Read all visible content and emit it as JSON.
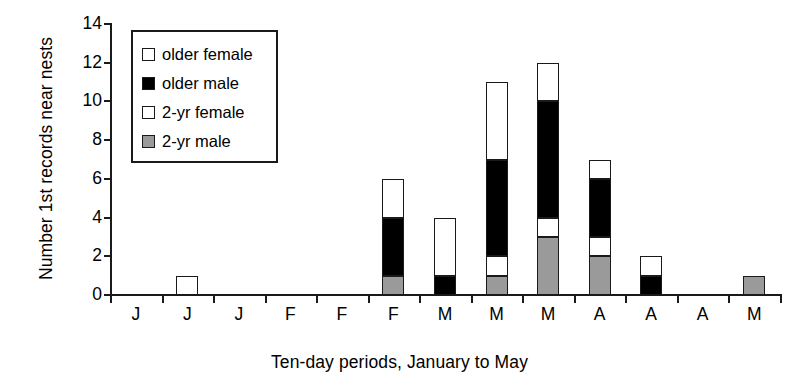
{
  "chart_data": {
    "type": "bar",
    "subtype": "stacked",
    "title": "",
    "xlabel": "Ten-day periods, January to May",
    "ylabel": "Number 1st records near nests",
    "categories": [
      "J",
      "J",
      "J",
      "F",
      "F",
      "F",
      "M",
      "M",
      "M",
      "A",
      "A",
      "A",
      "M"
    ],
    "ylim": [
      0,
      14
    ],
    "ytick_labels": [
      "0",
      "2",
      "4",
      "6",
      "8",
      "10",
      "12",
      "14"
    ],
    "ytick_values": [
      0,
      2,
      4,
      6,
      8,
      10,
      12,
      14
    ],
    "grid": false,
    "legend_position": "upper-left-inside",
    "series": [
      {
        "name": "2-yr male",
        "color": "#9a9a9a",
        "values": [
          0,
          0,
          0,
          0,
          0,
          1,
          0,
          1,
          3,
          2,
          0,
          0,
          1
        ]
      },
      {
        "name": "2-yr female",
        "color": "#ffffff",
        "values": [
          0,
          0,
          0,
          0,
          0,
          0,
          0,
          1,
          1,
          1,
          0,
          0,
          0
        ]
      },
      {
        "name": "older male",
        "color": "#000000",
        "values": [
          0,
          0,
          0,
          0,
          0,
          3,
          1,
          5,
          6,
          3,
          1,
          0,
          0
        ]
      },
      {
        "name": "older female",
        "color": "#ffffff",
        "values": [
          0,
          1,
          0,
          0,
          0,
          2,
          3,
          4,
          2,
          1,
          1,
          0,
          0
        ]
      }
    ],
    "totals": [
      0,
      1,
      0,
      0,
      0,
      6,
      4,
      11,
      12,
      7,
      2,
      0,
      1
    ]
  },
  "legend": {
    "items": [
      {
        "label": "older female",
        "swatch": "white"
      },
      {
        "label": "older male",
        "swatch": "black"
      },
      {
        "label": "2-yr female",
        "swatch": "white"
      },
      {
        "label": "2-yr male",
        "swatch": "gray"
      }
    ]
  },
  "colors": {
    "axis": "#1a1a1a",
    "older_female": "#ffffff",
    "older_male": "#000000",
    "two_yr_female": "#ffffff",
    "two_yr_male": "#9a9a9a"
  }
}
